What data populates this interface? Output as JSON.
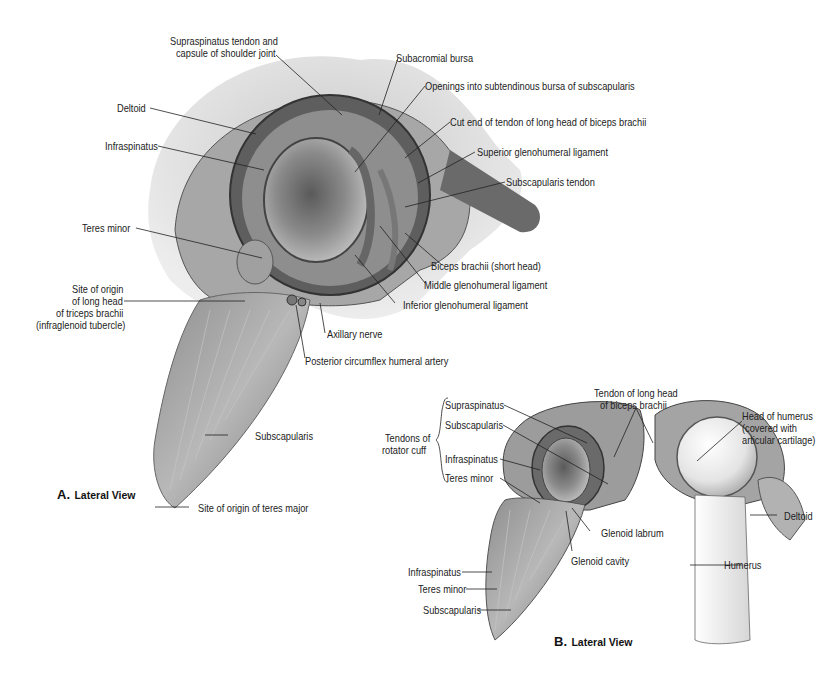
{
  "figure_a": {
    "caption_letter": "A.",
    "caption_view": "Lateral View",
    "labels": {
      "supraspinatus_tendon_1": "Supraspinatus tendon and",
      "supraspinatus_tendon_2": "capsule of shoulder joint",
      "subacromial_bursa": "Subacromial bursa",
      "openings": "Openings into subtendinous bursa of subscapularis",
      "cut_end": "Cut end of tendon of long head of biceps brachii",
      "superior_gh": "Superior glenohumeral ligament",
      "subscapularis_tendon": "Subscapularis tendon",
      "deltoid": "Deltoid",
      "infraspinatus": "Infraspinatus",
      "teres_minor": "Teres minor",
      "site_origin_1": "Site of origin",
      "site_origin_2": "of long head",
      "site_origin_3": "of triceps brachii",
      "site_origin_4": "(infraglenoid tubercle)",
      "biceps_short": "Biceps brachii (short head)",
      "middle_gh": "Middle glenohumeral ligament",
      "inferior_gh": "Inferior glenohumeral ligament",
      "axillary_nerve": "Axillary nerve",
      "posterior_circumflex": "Posterior circumflex humeral artery",
      "subscapularis": "Subscapularis",
      "teres_major": "Site of origin of teres major"
    }
  },
  "figure_b": {
    "caption_letter": "B.",
    "caption_view": "Lateral View",
    "labels": {
      "tendons_rc_1": "Tendons of",
      "tendons_rc_2": "rotator cuff",
      "supraspinatus": "Supraspinatus",
      "subscapularis": "Subscapularis",
      "infraspinatus": "Infraspinatus",
      "teres_minor": "Teres minor",
      "tendon_long_head_1": "Tendon of long head",
      "tendon_long_head_2": "of biceps brachii",
      "head_humerus_1": "Head of humerus",
      "head_humerus_2": "(covered with",
      "head_humerus_3": "articular cartilage)",
      "deltoid": "Deltoid",
      "glenoid_labrum": "Glenoid labrum",
      "glenoid_cavity": "Glenoid cavity",
      "humerus": "Humerus",
      "infraspinatus_low": "Infraspinatus",
      "teres_minor_low": "Teres minor",
      "subscapularis_low": "Subscapularis"
    }
  },
  "colors": {
    "muscle": "#9a9a9a",
    "dark": "#3a3a3a",
    "light": "#e6e6e6",
    "text": "#222222"
  }
}
